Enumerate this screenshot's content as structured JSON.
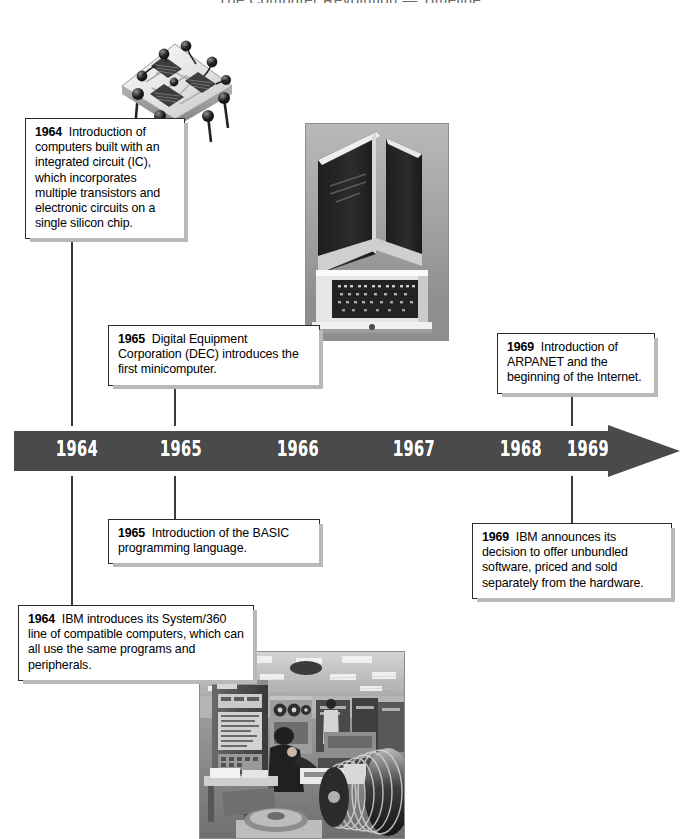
{
  "document": {
    "title_partial": "The Computer Revolution — Timeline",
    "subject": "History of computing timeline, 1964–1969",
    "background_color": "#ffffff",
    "bar_color": "#4a4a4a",
    "box_border_color": "#2b2b2b",
    "box_shadow_color": "#b9b9b9",
    "leader_line_color": "#3b3b3b"
  },
  "timeline": {
    "name": "timeline-axis",
    "years": [
      "1964",
      "1965",
      "1966",
      "1967",
      "1968",
      "1969"
    ],
    "year_x": [
      56,
      160,
      277,
      393,
      500,
      567
    ],
    "arrow_direction": "right",
    "bar_left": 14,
    "bar_right": 680,
    "bar_top": 425,
    "bar_height": 52
  },
  "callouts": [
    {
      "id": "callout-1964-ic",
      "year": "1964",
      "text": "Introduction of computers built with an integrated circuit (IC), which incorporates multiple transistors and electronic circuits on a single silicon chip.",
      "position": "above-left",
      "connects_to_year": "1964"
    },
    {
      "id": "callout-1965-dec",
      "year": "1965",
      "text": "Digital Equipment Corporation (DEC) introduces the first minicomputer.",
      "position": "above-center",
      "connects_to_year": "1965"
    },
    {
      "id": "callout-1969-arpanet",
      "year": "1969",
      "text": "Introduction of ARPANET and the beginning of the Internet.",
      "position": "above-right",
      "connects_to_year": "1969"
    },
    {
      "id": "callout-1965-basic",
      "year": "1965",
      "text": "Introduction of the BASIC programming language.",
      "position": "below-center",
      "connects_to_year": "1965"
    },
    {
      "id": "callout-1969-ibm-unbundling",
      "year": "1969",
      "text": "IBM announces its decision to offer unbundled software, priced and sold separately from the hardware.",
      "position": "below-right",
      "connects_to_year": "1969"
    },
    {
      "id": "callout-1964-system360",
      "year": "1964",
      "text": "IBM introduces its System/360 line of compatible computers, which can all use the same programs and peripherals.",
      "position": "below-left",
      "connects_to_year": "1964"
    }
  ],
  "images": [
    {
      "id": "photo-integrated-circuit",
      "name": "integrated-circuit-illustration",
      "caption_ref": "callout-1964-ic",
      "description": "Close-up of an integrated circuit package with dies, bond wires and metal pins, shown at an angle"
    },
    {
      "id": "photo-minicomputer",
      "name": "minicomputer-photo",
      "caption_ref": "callout-1965-dec",
      "description": "Black and white photograph of a tall DEC minicomputer cabinet with control panel"
    },
    {
      "id": "photo-mainframe-room",
      "name": "mainframe-computer-room-photo",
      "caption_ref": "callout-1964-system360",
      "description": "Black and white photograph of an IBM System/360 computer room with an operator at a console, tape drives and disk packs"
    }
  ]
}
